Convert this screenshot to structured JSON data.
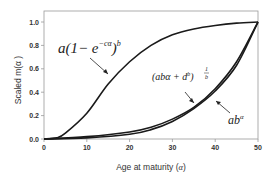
{
  "chart_data": {
    "type": "line",
    "title": "",
    "xlabel": "Age at maturity (α)",
    "ylabel": "Scaled m(α )",
    "xlim": [
      0,
      50
    ],
    "ylim": [
      0,
      1.05
    ],
    "xticks": [
      0,
      10,
      20,
      30,
      40,
      50
    ],
    "yticks": [
      0.0,
      0.2,
      0.4,
      0.6,
      0.8,
      1.0
    ],
    "xtick_labels": [
      "0",
      "10",
      "20",
      "30",
      "40",
      "50"
    ],
    "ytick_labels": [
      "0.0",
      "0.2",
      "0.4",
      "0.6",
      "0.8",
      "1.0"
    ],
    "grid": false,
    "legend": "none (inline annotations with arrows)",
    "series": [
      {
        "name": "a(1 - e^(-cα))^b",
        "x": [
          0,
          3,
          5,
          10,
          15,
          20,
          25,
          30,
          35,
          40,
          45,
          50
        ],
        "values": [
          0.0,
          0.01,
          0.05,
          0.22,
          0.47,
          0.66,
          0.8,
          0.89,
          0.94,
          0.97,
          0.99,
          1.0
        ]
      },
      {
        "name": "(abα + d^b)^(1/b)",
        "x": [
          0,
          10,
          20,
          25,
          30,
          35,
          40,
          45,
          50
        ],
        "values": [
          0.0,
          0.02,
          0.06,
          0.1,
          0.17,
          0.27,
          0.43,
          0.66,
          1.0
        ]
      },
      {
        "name": "ab^α",
        "x": [
          0,
          10,
          20,
          25,
          30,
          35,
          40,
          45,
          50
        ],
        "values": [
          0.0,
          0.01,
          0.04,
          0.08,
          0.15,
          0.26,
          0.41,
          0.63,
          1.0
        ]
      }
    ],
    "annotations": [
      {
        "text": "a(1 - e^(-cα))^b",
        "points_to": "series 0 near α≈15"
      },
      {
        "text": "(abα + d^b)^(1/b)",
        "points_to": "series 1 near α≈33"
      },
      {
        "text": "ab^α",
        "points_to": "series 2 near α≈38"
      }
    ]
  },
  "labels": {
    "xlabel_text": "Age at maturity (",
    "xlabel_var": "α",
    "xlabel_close": ")",
    "ylabel": "Scaled m(α )",
    "ann1": "a(1− e",
    "ann1_exp": "−cα",
    "ann1_close": ")",
    "ann1_pow": "b",
    "ann2": "(abα + d",
    "ann2_exp": "b",
    "ann2_close": ")",
    "ann2_pow_num": "1",
    "ann2_pow_den": "b",
    "ann3": "ab",
    "ann3_exp": "α"
  }
}
